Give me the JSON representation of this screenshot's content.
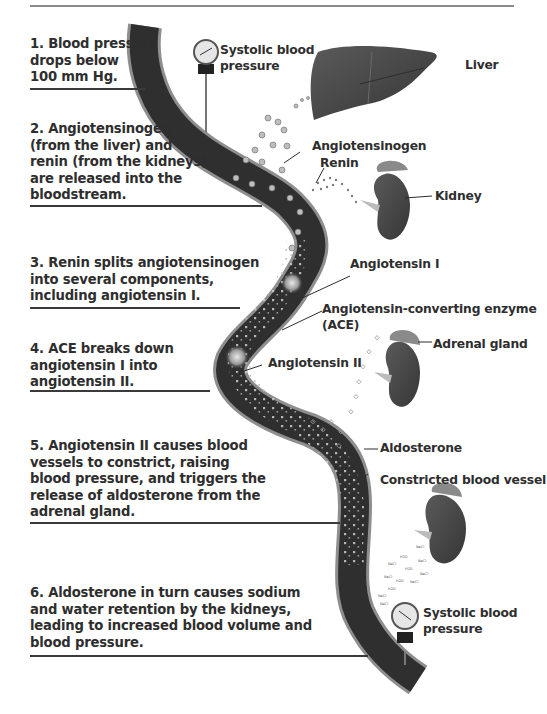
{
  "diagram": {
    "title_cut_off": true,
    "type": "renin-angiotensin-aldosterone system flow",
    "steps": [
      {
        "number": "1",
        "lines": [
          "1. Blood pressure",
          "drops below",
          "100 mm Hg."
        ]
      },
      {
        "number": "2",
        "lines": [
          "2. Angiotensinogen",
          "(from the liver) and",
          "renin (from the kidneys)",
          "are released into the",
          "bloodstream."
        ]
      },
      {
        "number": "3",
        "lines": [
          "3. Renin splits angiotensinogen",
          "into several components,",
          "including angiotensin I."
        ]
      },
      {
        "number": "4",
        "lines": [
          "4. ACE breaks down",
          "angiotensin I into",
          "angiotensin II."
        ]
      },
      {
        "number": "5",
        "lines": [
          "5. Angiotensin II causes blood",
          "vessels to constrict, raising",
          "blood pressure, and triggers the",
          "release of aldosterone from the",
          "adrenal gland."
        ]
      },
      {
        "number": "6",
        "lines": [
          "6. Aldosterone in turn causes sodium",
          "and water retention by the kidneys,",
          "leading to increased blood volume and",
          "blood pressure."
        ]
      }
    ],
    "labels": {
      "systolic_top": [
        "Systolic blood",
        "pressure"
      ],
      "liver": "Liver",
      "angiotensinogen": "Angiotensinogen",
      "renin": "Renin",
      "kidney": "Kidney",
      "angiotensin_1": "Angiotensin I",
      "ace": [
        "Angiotensin-converting enzyme",
        "(ACE)"
      ],
      "angiotensin_2": "Angiotensin II",
      "adrenal_gland": "Adrenal gland",
      "aldosterone": "Aldosterone",
      "constricted_vessel": "Constricted blood vessel",
      "systolic_bottom": [
        "Systolic blood",
        "pressure"
      ],
      "molecules": [
        "NaCl",
        "H2O"
      ]
    },
    "colors": {
      "vessel_fill": "#2f2f2f",
      "vessel_wall": "#8e8e8e",
      "organ": "#4a4a4a",
      "text": "#2e2e2e",
      "rule": "#3a3a3a"
    }
  }
}
